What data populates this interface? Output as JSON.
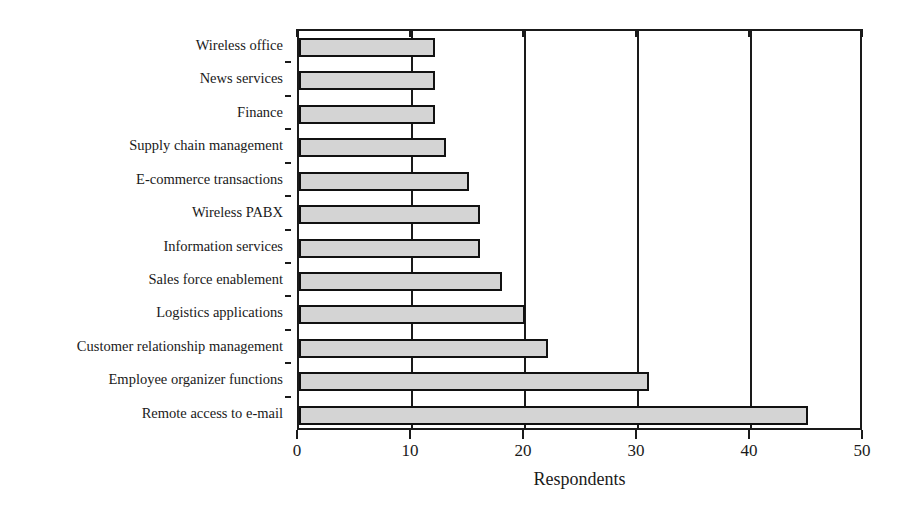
{
  "chart_data": {
    "type": "bar",
    "orientation": "horizontal",
    "title": "",
    "subtitle": "",
    "xlabel": "Respondents",
    "ylabel": "",
    "xlim": [
      0,
      50
    ],
    "xticks": [
      0,
      10,
      20,
      30,
      40,
      50
    ],
    "xticklabels": [
      "0",
      "10",
      "20",
      "30",
      "40",
      "50"
    ],
    "grid": "vertical-major",
    "legend": null,
    "bar_fill_color": "#d4d4d4",
    "bar_edge_color": "#111111",
    "axis_color": "#1a1a1a",
    "categories": [
      "Wireless office",
      "News services",
      "Finance",
      "Supply chain management",
      "E-commerce transactions",
      "Wireless PABX",
      "Information services",
      "Sales force enablement",
      "Logistics applications",
      "Customer relationship management",
      "Employee organizer functions",
      "Remote access to e-mail"
    ],
    "values": [
      12,
      12,
      12,
      13,
      15,
      16,
      16,
      18,
      20,
      22,
      31,
      45
    ]
  }
}
